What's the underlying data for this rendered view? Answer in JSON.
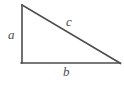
{
  "diagram": {
    "type": "right-triangle",
    "stroke_color": "#4d4d4d",
    "background_color": "#ffffff",
    "stroke_width": 1.6,
    "vertices": {
      "top": [
        22,
        5
      ],
      "bottom_left": [
        22,
        63
      ],
      "bottom_right": [
        120,
        63
      ]
    },
    "sides": [
      {
        "name": "vertical-leg",
        "label": "a",
        "from": "top",
        "to": "bottom_left"
      },
      {
        "name": "horizontal-leg",
        "label": "b",
        "from": "bottom_left",
        "to": "bottom_right"
      },
      {
        "name": "hypotenuse",
        "label": "c",
        "from": "top",
        "to": "bottom_right"
      }
    ],
    "labels": {
      "a": "a",
      "b": "b",
      "c": "c"
    }
  }
}
